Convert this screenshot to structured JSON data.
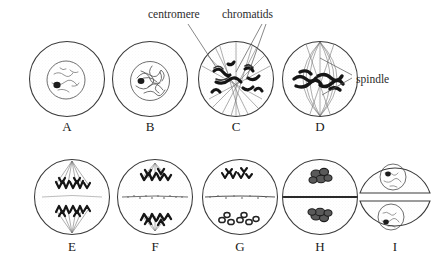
{
  "figure": {
    "background_color": "#ffffff",
    "ink_color": "#1a1a1a"
  },
  "callouts": [
    {
      "id": "centromere",
      "label": "centromere",
      "text_x": 148,
      "text_y": 18,
      "leaders": [
        {
          "x1": 188,
          "y1": 24,
          "x2": 216,
          "y2": 67
        }
      ]
    },
    {
      "id": "chromatids",
      "label": "chromatids",
      "text_x": 222,
      "text_y": 18,
      "leaders": [
        {
          "x1": 262,
          "y1": 24,
          "x2": 236,
          "y2": 72
        },
        {
          "x1": 266,
          "y1": 24,
          "x2": 246,
          "y2": 80
        }
      ]
    },
    {
      "id": "spindle",
      "label": "spindle",
      "text_x": 356,
      "text_y": 79,
      "leaders": [
        {
          "x1": 352,
          "y1": 75,
          "x2": 320,
          "y2": 58
        },
        {
          "x1": 352,
          "y1": 78,
          "x2": 322,
          "y2": 95
        }
      ]
    }
  ],
  "cells": [
    {
      "id": "cell-a",
      "letter": "A",
      "phase": "interphase",
      "cx": 67,
      "cy": 79,
      "r": 38,
      "label_x": 67,
      "label_y": 131,
      "has_nucleus": true,
      "nucleus_r": 19,
      "has_nucleolus": true,
      "has_spindle": false,
      "has_plate": false,
      "description": "Interphase cell with intact nucleus, dark nucleolus and diffuse chromatin"
    },
    {
      "id": "cell-b",
      "letter": "B",
      "phase": "early prophase",
      "cx": 150,
      "cy": 79,
      "r": 38,
      "label_x": 150,
      "label_y": 131,
      "has_nucleus": true,
      "nucleus_r": 19,
      "has_nucleolus": true,
      "has_spindle": false,
      "has_plate": false,
      "description": "Early prophase with condensing thread-like chromosomes inside nucleus"
    },
    {
      "id": "cell-c",
      "letter": "C",
      "phase": "late prophase",
      "cx": 236,
      "cy": 79,
      "r": 38,
      "label_x": 236,
      "label_y": 131,
      "has_nucleus": false,
      "nucleus_r": 0,
      "has_nucleolus": false,
      "has_spindle": true,
      "has_plate": false,
      "description": "Late prophase: nuclear envelope gone, thick double chromosomes scattered, spindle forming"
    },
    {
      "id": "cell-d",
      "letter": "D",
      "phase": "metaphase",
      "cx": 320,
      "cy": 79,
      "r": 38,
      "label_x": 320,
      "label_y": 131,
      "has_nucleus": false,
      "nucleus_r": 0,
      "has_nucleolus": false,
      "has_spindle": true,
      "has_plate": false,
      "description": "Metaphase: chromosomes aligned on the equatorial plate between spindle poles"
    },
    {
      "id": "cell-e",
      "letter": "E",
      "phase": "anaphase",
      "cx": 72,
      "cy": 197,
      "r": 38,
      "label_x": 72,
      "label_y": 251,
      "has_nucleus": false,
      "nucleus_r": 0,
      "has_nucleolus": false,
      "has_spindle": true,
      "has_plate": false,
      "description": "Anaphase: V-shaped chromosomes pulled toward opposite poles"
    },
    {
      "id": "cell-f",
      "letter": "F",
      "phase": "late anaphase",
      "cx": 155,
      "cy": 197,
      "r": 38,
      "label_x": 155,
      "label_y": 251,
      "has_nucleus": false,
      "nucleus_r": 0,
      "has_nucleolus": false,
      "has_spindle": true,
      "has_plate": true,
      "description": "Late anaphase / early telophase: chromosomes at poles, cell plate vesicles at equator"
    },
    {
      "id": "cell-g",
      "letter": "G",
      "phase": "telophase",
      "cx": 240,
      "cy": 197,
      "r": 38,
      "label_x": 240,
      "label_y": 251,
      "has_nucleus": false,
      "nucleus_r": 0,
      "has_nucleolus": false,
      "has_spindle": false,
      "has_plate": true,
      "description": "Telophase: chromosome clusters at each pole, cell plate extending across equator"
    },
    {
      "id": "cell-h",
      "letter": "H",
      "phase": "cytokinesis",
      "cx": 320,
      "cy": 197,
      "r": 38,
      "label_x": 320,
      "label_y": 251,
      "has_nucleus": false,
      "nucleus_r": 0,
      "has_nucleolus": false,
      "has_spindle": false,
      "has_plate": true,
      "description": "Cytokinesis: complete cell plate divides the cell, chromatin masses reforming"
    },
    {
      "id": "cell-i",
      "letter": "I",
      "phase": "daughter cells",
      "cx": 395,
      "cy": 197,
      "r": 38,
      "label_x": 395,
      "label_y": 251,
      "has_nucleus": true,
      "nucleus_r": 15,
      "has_nucleolus": true,
      "has_spindle": false,
      "has_plate": false,
      "description": "Two separated daughter cells, each with a reformed nucleus and nucleolus"
    }
  ]
}
